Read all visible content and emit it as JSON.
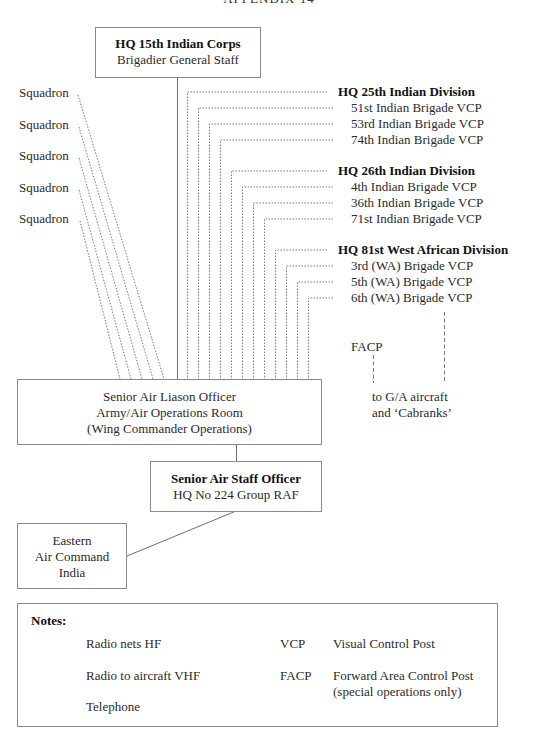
{
  "page": {
    "running_head": "APPENDIX 14"
  },
  "boxes": {
    "corps": {
      "title": "HQ 15th Indian Corps",
      "subtitle": "Brigadier General Staff"
    },
    "salo": {
      "line1": "Senior Air Liason Officer",
      "line2": "Army/Air Operations Room",
      "line3": "(Wing Commander Operations)"
    },
    "saso": {
      "title": "Senior Air Staff Officer",
      "subtitle": "HQ No 224 Group RAF"
    },
    "eac": {
      "line1": "Eastern",
      "line2": "Air Command",
      "line3": "India"
    }
  },
  "squadrons": [
    "Squadron",
    "Squadron",
    "Squadron",
    "Squadron",
    "Squadron"
  ],
  "divisions": [
    {
      "hq": "HQ 25th Indian Division",
      "brigades": [
        "51st Indian Brigade VCP",
        "53rd Indian Brigade VCP",
        "74th Indian Brigade VCP"
      ]
    },
    {
      "hq": "HQ 26th Indian Division",
      "brigades": [
        "4th Indian Brigade VCP",
        "36th Indian Brigade VCP",
        "71st Indian Brigade VCP"
      ]
    },
    {
      "hq": "HQ 81st West African Division",
      "brigades": [
        "3rd (WA) Brigade VCP",
        "5th (WA) Brigade VCP",
        "6th (WA) Brigade VCP"
      ]
    }
  ],
  "facp": {
    "label": "FACP",
    "target_line1": "to G/A aircraft",
    "target_line2": "and ‘Cabranks’"
  },
  "notes": {
    "title": "Notes:",
    "legend": [
      {
        "style": "dotted",
        "label": "Radio nets HF"
      },
      {
        "style": "dashed",
        "label": "Radio to aircraft VHF"
      },
      {
        "style": "solid",
        "label": "Telephone"
      }
    ],
    "abbreviations": [
      {
        "abbr": "VCP",
        "meaning": "Visual Control Post"
      },
      {
        "abbr": "FACP",
        "meaning": "Forward Area Control Post",
        "meaning2": "(special operations only)"
      }
    ]
  },
  "colors": {
    "line": "#6e6e6e",
    "box_border": "#8a8a8a",
    "text": "#2a2a2a"
  }
}
